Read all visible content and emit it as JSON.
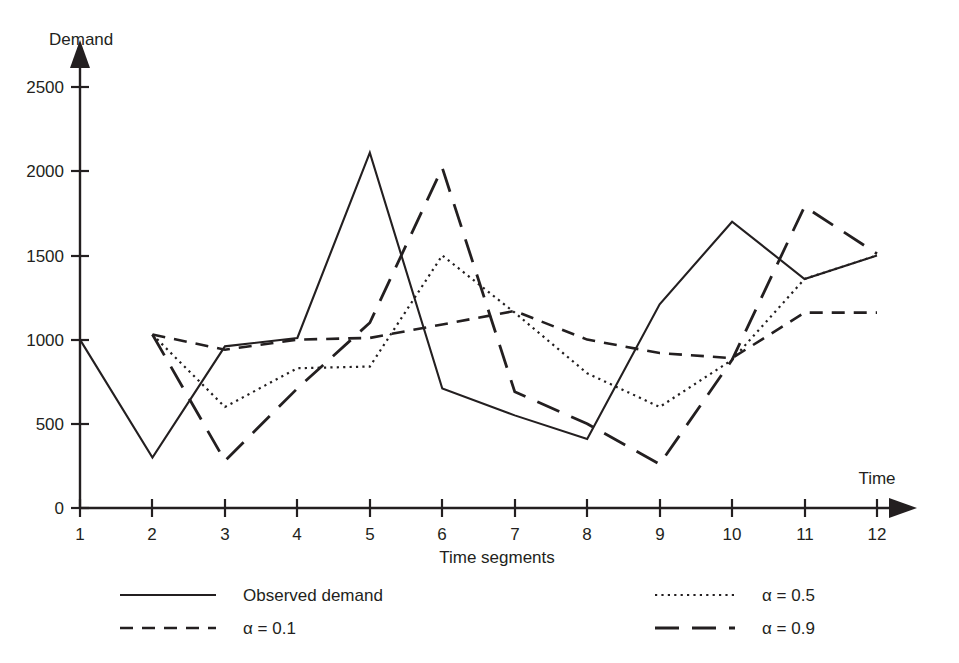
{
  "chart_data": {
    "type": "line",
    "title": "",
    "xlabel": "Time segments",
    "ylabel": "Demand",
    "x_axis_name": "Time",
    "y_axis_name": "Demand",
    "categories": [
      1,
      2,
      3,
      4,
      5,
      6,
      7,
      8,
      9,
      10,
      11,
      12
    ],
    "x_tick_labels": [
      "1",
      "2",
      "3",
      "4",
      "5",
      "6",
      "7",
      "8",
      "9",
      "10",
      "11",
      "12"
    ],
    "y_tick_labels": [
      "0",
      "500",
      "1000",
      "1500",
      "2000",
      "2500"
    ],
    "y_ticks": [
      0,
      500,
      1000,
      1500,
      2000,
      2500
    ],
    "xlim": [
      1,
      12
    ],
    "ylim": [
      0,
      2700
    ],
    "grid": false,
    "legend_position": "below-plot",
    "series": [
      {
        "name": "Observed demand",
        "style": "solid",
        "x": [
          1,
          2,
          3,
          4,
          5,
          6,
          7,
          8,
          9,
          10,
          11,
          12
        ],
        "values": [
          1000,
          300,
          960,
          1010,
          2110,
          710,
          550,
          410,
          1210,
          1700,
          1360,
          1500
        ]
      },
      {
        "name": "α = 0.1",
        "style": "dashed-short",
        "x": [
          2,
          3,
          4,
          5,
          6,
          7,
          8,
          9,
          10,
          11,
          12
        ],
        "values": [
          1030,
          940,
          1000,
          1010,
          1090,
          1170,
          1000,
          920,
          890,
          1160,
          1160
        ]
      },
      {
        "name": "α = 0.5",
        "style": "dotted",
        "x": [
          2,
          3,
          4,
          5,
          6,
          7,
          8,
          9,
          10,
          11,
          12
        ],
        "values": [
          1030,
          600,
          830,
          840,
          1500,
          1160,
          800,
          600,
          880,
          1360,
          1500
        ]
      },
      {
        "name": "α = 0.9",
        "style": "dashed-long",
        "x": [
          2,
          3,
          4,
          5,
          6,
          7,
          8,
          9,
          10,
          11,
          12
        ],
        "values": [
          1030,
          280,
          710,
          1100,
          2020,
          690,
          500,
          260,
          880,
          1790,
          1510
        ]
      }
    ]
  },
  "legend": {
    "entries": [
      {
        "label": "Observed demand",
        "style": "solid"
      },
      {
        "label": "α = 0.1",
        "style": "dashed-short"
      },
      {
        "label": "α = 0.5",
        "style": "dotted"
      },
      {
        "label": "α = 0.9",
        "style": "dashed-long"
      }
    ]
  },
  "colors": {
    "ink": "#231f20",
    "background": "#ffffff"
  }
}
